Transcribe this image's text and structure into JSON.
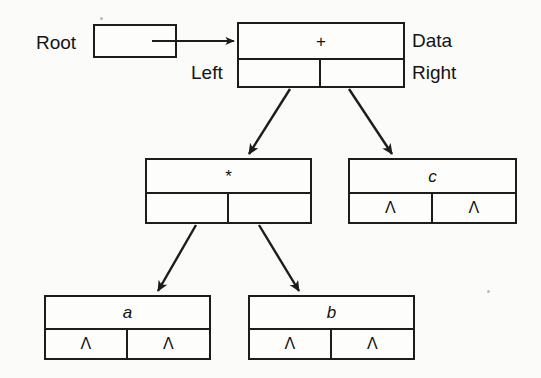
{
  "diagram": {
    "background_color": "#fbfbfa",
    "stroke_color": "#1c1c1c",
    "null_symbol": "Λ",
    "labels": {
      "root": "Root",
      "data": "Data",
      "left": "Left",
      "right": "Right"
    },
    "nodes": [
      {
        "id": "node-plus",
        "data": "+",
        "italic": false,
        "left_ptr": "",
        "right_ptr": "",
        "left_is_null": false,
        "right_is_null": false
      },
      {
        "id": "node-times",
        "data": "*",
        "italic": false,
        "left_ptr": "",
        "right_ptr": "",
        "left_is_null": false,
        "right_is_null": false
      },
      {
        "id": "node-c",
        "data": "c",
        "italic": true,
        "left_ptr": "Λ",
        "right_ptr": "Λ",
        "left_is_null": true,
        "right_is_null": true
      },
      {
        "id": "node-a",
        "data": "a",
        "italic": true,
        "left_ptr": "Λ",
        "right_ptr": "Λ",
        "left_is_null": true,
        "right_is_null": true
      },
      {
        "id": "node-b",
        "data": "b",
        "italic": true,
        "left_ptr": "Λ",
        "right_ptr": "Λ",
        "left_is_null": true,
        "right_is_null": true
      }
    ],
    "edges": [
      {
        "id": "edge-root-to-plus",
        "from": "root-pointer",
        "to": "node-plus"
      },
      {
        "id": "edge-plus-left",
        "from": "node-plus",
        "to": "node-times"
      },
      {
        "id": "edge-plus-right",
        "from": "node-plus",
        "to": "node-c"
      },
      {
        "id": "edge-times-left",
        "from": "node-times",
        "to": "node-a"
      },
      {
        "id": "edge-times-right",
        "from": "node-times",
        "to": "node-b"
      }
    ]
  }
}
